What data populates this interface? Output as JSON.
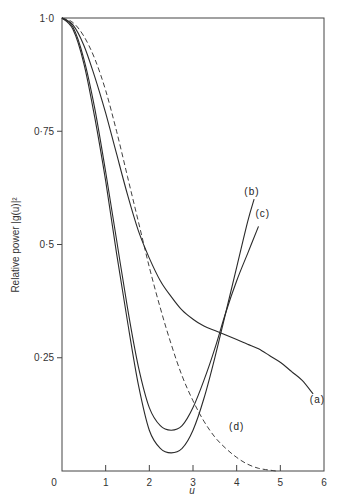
{
  "chart_data": {
    "type": "line",
    "title": "",
    "xlabel": "u",
    "ylabel": "Relative power |g(u)|²",
    "xlim": [
      0,
      6
    ],
    "ylim": [
      0,
      1.0
    ],
    "x_ticks": [
      0,
      1,
      2,
      3,
      4,
      5,
      6
    ],
    "x_tick_labels": [
      "0",
      "1",
      "2",
      "3",
      "4",
      "5",
      "6"
    ],
    "y_ticks": [
      0.25,
      0.5,
      0.75,
      1.0
    ],
    "y_tick_labels": [
      "0·25",
      "0·5",
      "0·75",
      "1·0"
    ],
    "grid": false,
    "legend": "inline curve labels",
    "series": [
      {
        "name": "(a)",
        "style": "solid",
        "x": [
          0,
          0.25,
          0.5,
          0.75,
          1.0,
          1.25,
          1.5,
          1.75,
          2.0,
          2.25,
          2.5,
          2.75,
          3.0,
          3.25,
          3.5,
          3.75,
          4.0,
          4.25,
          4.5,
          4.75,
          5.0,
          5.25,
          5.5,
          5.75
        ],
        "y": [
          1.0,
          0.985,
          0.94,
          0.87,
          0.79,
          0.7,
          0.61,
          0.53,
          0.47,
          0.42,
          0.385,
          0.355,
          0.335,
          0.32,
          0.31,
          0.3,
          0.29,
          0.28,
          0.27,
          0.255,
          0.24,
          0.22,
          0.2,
          0.17
        ]
      },
      {
        "name": "(b)",
        "style": "solid",
        "x": [
          0,
          0.25,
          0.5,
          0.75,
          1.0,
          1.25,
          1.5,
          1.75,
          2.0,
          2.25,
          2.5,
          2.75,
          3.0,
          3.25,
          3.5,
          3.75,
          4.0,
          4.25,
          4.4
        ],
        "y": [
          1.0,
          0.975,
          0.9,
          0.78,
          0.64,
          0.48,
          0.33,
          0.19,
          0.09,
          0.05,
          0.04,
          0.05,
          0.09,
          0.16,
          0.25,
          0.35,
          0.45,
          0.55,
          0.6
        ]
      },
      {
        "name": "(c)",
        "style": "solid",
        "x": [
          0,
          0.25,
          0.5,
          0.75,
          1.0,
          1.25,
          1.5,
          1.75,
          2.0,
          2.25,
          2.5,
          2.75,
          3.0,
          3.25,
          3.5,
          3.75,
          4.0,
          4.25,
          4.5
        ],
        "y": [
          1.0,
          0.98,
          0.91,
          0.8,
          0.66,
          0.51,
          0.36,
          0.23,
          0.14,
          0.1,
          0.09,
          0.1,
          0.14,
          0.2,
          0.27,
          0.35,
          0.42,
          0.48,
          0.54
        ]
      },
      {
        "name": "(d)",
        "style": "dashed",
        "x": [
          0,
          0.25,
          0.5,
          0.75,
          1.0,
          1.25,
          1.5,
          1.75,
          2.0,
          2.25,
          2.5,
          2.75,
          3.0,
          3.25,
          3.5,
          3.75,
          4.0,
          4.25,
          4.5,
          4.75,
          4.9
        ],
        "y": [
          1.0,
          0.99,
          0.96,
          0.91,
          0.84,
          0.75,
          0.65,
          0.55,
          0.45,
          0.36,
          0.28,
          0.21,
          0.155,
          0.11,
          0.075,
          0.05,
          0.03,
          0.015,
          0.006,
          0.002,
          0.0
        ]
      }
    ],
    "annotations": [
      {
        "text": "(a)",
        "x": 5.85,
        "y": 0.15
      },
      {
        "text": "(b)",
        "x": 4.35,
        "y": 0.61
      },
      {
        "text": "(c)",
        "x": 4.6,
        "y": 0.56
      },
      {
        "text": "(d)",
        "x": 4.0,
        "y": 0.09
      }
    ]
  }
}
